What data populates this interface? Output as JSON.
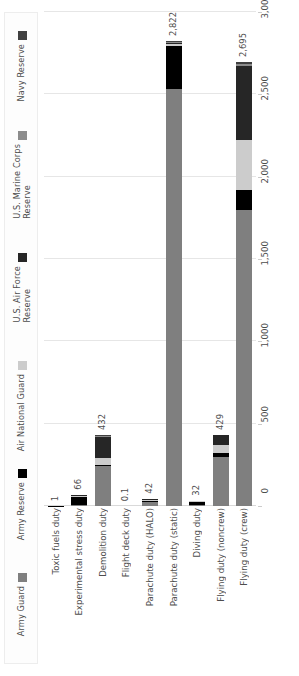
{
  "chart_data": {
    "type": "bar",
    "orientation": "vertical-stacked",
    "title": "",
    "subtitle": "",
    "xlabel": "",
    "ylabel": "",
    "ylim": [
      0,
      3000
    ],
    "grid": true,
    "legend_position": "left",
    "yticks": [
      "0",
      "500",
      "1,000",
      "1,500",
      "2,000",
      "2,500",
      "3,000"
    ],
    "ytick_values": [
      0,
      500,
      1000,
      1500,
      2000,
      2500,
      3000
    ],
    "categories": [
      "Toxic fuels duty",
      "Experimental stress duty",
      "Demolition duty",
      "Flight deck duty",
      "Parachute duty (HALO)",
      "Parachute duty (static)",
      "Diving duty",
      "Flying duty (noncrew)",
      "Flying duty (crew)"
    ],
    "totals_labels": [
      "1",
      "66",
      "432",
      "0.1",
      "42",
      "2,822",
      "32",
      "429",
      "2,695"
    ],
    "totals": [
      1,
      66,
      432,
      0.1,
      42,
      2822,
      32,
      429,
      2695
    ],
    "series": [
      {
        "name": "Army Guard",
        "color": "#7f7f7f",
        "values": [
          0,
          4,
          246,
          0,
          34,
          2540,
          5,
          300,
          1800
        ]
      },
      {
        "name": "Army Reserve",
        "color": "#000000",
        "values": [
          1,
          58,
          10,
          0,
          6,
          262,
          25,
          22,
          120
        ]
      },
      {
        "name": "Air National Guard",
        "color": "#cccccc",
        "values": [
          0,
          2,
          40,
          0,
          1,
          8,
          1,
          50,
          300
        ]
      },
      {
        "name": "U.S. Air Force Reserve",
        "color": "#262626",
        "values": [
          0,
          2,
          132,
          0,
          1,
          6,
          1,
          57,
          450
        ]
      },
      {
        "name": "U.S. Marine Corps Reserve",
        "color": "#8c8c8c",
        "values": [
          0,
          0,
          2,
          0.05,
          0,
          4,
          0,
          0,
          14
        ]
      },
      {
        "name": "Navy Reserve",
        "color": "#404040",
        "values": [
          0,
          0,
          2,
          0.05,
          0,
          2,
          0,
          0,
          11
        ]
      }
    ]
  },
  "legend": {
    "items": [
      {
        "label": "Army Guard",
        "color": "#7f7f7f"
      },
      {
        "label": "Army Reserve",
        "color": "#000000"
      },
      {
        "label": "Air National Guard",
        "color": "#cccccc"
      },
      {
        "label": "U.S. Air Force\nReserve",
        "color": "#262626"
      },
      {
        "label": "U.S. Marine Corps\nReserve",
        "color": "#8c8c8c"
      },
      {
        "label": "Navy Reserve",
        "color": "#404040"
      }
    ]
  }
}
